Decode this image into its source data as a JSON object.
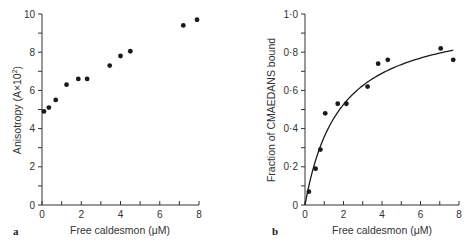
{
  "chart_data": [
    {
      "panel": "a",
      "type": "scatter",
      "title": "",
      "xlabel": "Free caldesmon  (μM)",
      "ylabel": "Anisotropy (A×10²)",
      "xlim": [
        0,
        8
      ],
      "ylim": [
        0,
        10
      ],
      "xticks": [
        0,
        2,
        4,
        6,
        8
      ],
      "yticks": [
        0,
        2,
        4,
        6,
        8,
        10
      ],
      "grid": false,
      "series": [
        {
          "name": "anisotropy",
          "x": [
            0.1,
            0.35,
            0.7,
            1.25,
            1.85,
            2.3,
            3.45,
            4.0,
            4.5,
            7.2,
            7.9
          ],
          "y": [
            4.9,
            5.1,
            5.5,
            6.3,
            6.6,
            6.6,
            7.3,
            7.8,
            8.05,
            9.4,
            9.7
          ]
        }
      ]
    },
    {
      "panel": "b",
      "type": "scatter",
      "title": "",
      "xlabel": "Free caldesmon  (μM)",
      "ylabel": "Fraction of CMAEDANS bound",
      "xlim": [
        0,
        8
      ],
      "ylim": [
        0,
        1.0
      ],
      "xticks": [
        0,
        2,
        4,
        6,
        8
      ],
      "yticks": [
        0,
        0.2,
        0.4,
        0.6,
        0.8,
        1.0
      ],
      "grid": false,
      "series": [
        {
          "name": "fraction bound",
          "x": [
            0.2,
            0.55,
            0.8,
            1.05,
            1.7,
            2.15,
            3.25,
            3.8,
            4.3,
            7.05,
            7.7
          ],
          "y": [
            0.07,
            0.19,
            0.29,
            0.48,
            0.53,
            0.53,
            0.62,
            0.74,
            0.76,
            0.82,
            0.76
          ]
        },
        {
          "name": "fitted binding curve",
          "type": "line",
          "model": "y = Bmax*x/(Kd+x)",
          "Bmax": 1.0,
          "Kd": 1.8,
          "x_range": [
            0,
            7.7
          ]
        }
      ]
    }
  ],
  "panels": {
    "a": {
      "label": "a",
      "xlabel": "Free caldesmon  (μM)",
      "ylabel": "Anisotropy (A×10",
      "ylabel_sup": "2",
      "ylabel_close": ")",
      "xtick_labels": [
        "0",
        "2",
        "4",
        "6",
        "8"
      ],
      "ytick_labels": [
        "0",
        "2",
        "4",
        "6",
        "8",
        "10"
      ]
    },
    "b": {
      "label": "b",
      "xlabel": "Free caldesmon  (μM)",
      "ylabel": "Fraction of CMAEDANS  bound",
      "xtick_labels": [
        "0",
        "2",
        "4",
        "6",
        "8"
      ],
      "ytick_labels": [
        "0",
        "0·2",
        "0·4",
        "0·6",
        "0·8",
        "1·0"
      ]
    }
  },
  "colors": {
    "ink": "#1a1a1a",
    "axis": "#333333",
    "background": "#ffffff"
  }
}
